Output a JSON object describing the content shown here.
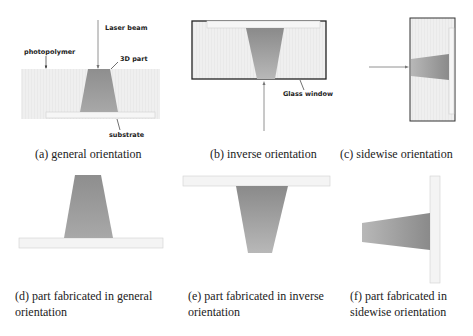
{
  "figure": {
    "panels": [
      {
        "id": "a",
        "caption": "(a) general orientation",
        "labels": {
          "laser": "Laser beam",
          "photopolymer": "photopolymer",
          "part": "3D part",
          "substrate": "substrate"
        }
      },
      {
        "id": "b",
        "caption": "(b) inverse orientation",
        "labels": {
          "window": "Glass window"
        }
      },
      {
        "id": "c",
        "caption": "(c) sidewise orientation"
      },
      {
        "id": "d",
        "caption_line1": "(d) part fabricated in general",
        "caption_line2": "orientation"
      },
      {
        "id": "e",
        "caption_line1": "(e) part fabricated in inverse",
        "caption_line2": "orientation"
      },
      {
        "id": "f",
        "caption_line1": "(f) part fabricated in",
        "caption_line2": "sidewise orientation"
      }
    ],
    "colors": {
      "resin": "#efefef",
      "substrate": "#f3f3f3",
      "part_dark": "#8a8a8a",
      "part_light": "#b5b5b5",
      "frame": "#222222",
      "line": "#666666"
    }
  }
}
